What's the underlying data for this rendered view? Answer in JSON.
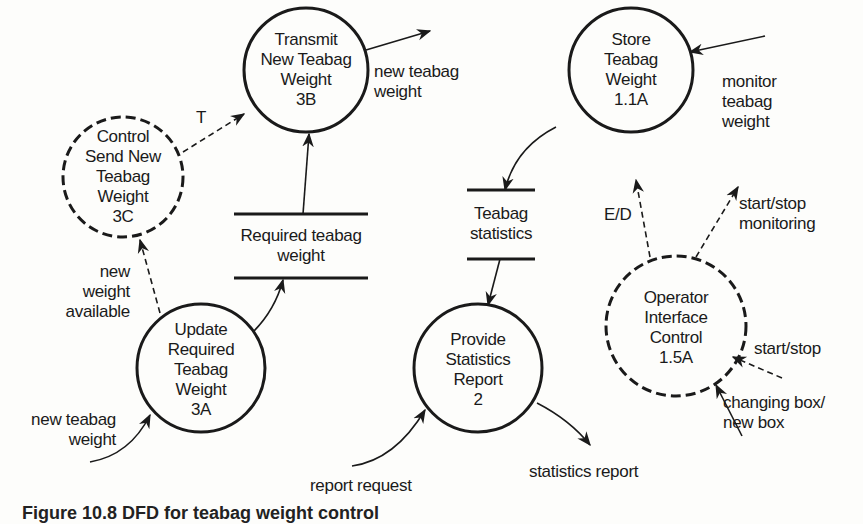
{
  "diagram": {
    "type": "data-flow-diagram",
    "processes": [
      {
        "id": "3C",
        "label": "Control\nSend New\nTeabag\nWeight\n3C",
        "style": "dashed",
        "kind": "control"
      },
      {
        "id": "3B",
        "label": "Transmit\nNew Teabag\nWeight\n3B",
        "style": "solid",
        "kind": "data"
      },
      {
        "id": "1.1A",
        "label": "Store\nTeabag\nWeight\n1.1A",
        "style": "solid",
        "kind": "data"
      },
      {
        "id": "1.5A",
        "label": "Operator\nInterface\nControl\n1.5A",
        "style": "dashed",
        "kind": "control"
      },
      {
        "id": "3A",
        "label": "Update\nRequired\nTeabag\nWeight\n3A",
        "style": "solid",
        "kind": "data"
      },
      {
        "id": "2",
        "label": "Provide\nStatistics\nReport\n2",
        "style": "solid",
        "kind": "data"
      }
    ],
    "stores": [
      {
        "id": "required-teabag-weight",
        "label": "Required teabag\nweight"
      },
      {
        "id": "teabag-statistics",
        "label": "Teabag\nstatistics"
      }
    ],
    "flows": [
      {
        "label": "T",
        "from": "3C",
        "to": "3B",
        "style": "dashed"
      },
      {
        "label": "new teabag\nweight",
        "from": "3B",
        "to": "external",
        "style": "solid"
      },
      {
        "label": "monitor\nteabag\nweight",
        "from": "external",
        "to": "1.1A",
        "style": "solid"
      },
      {
        "label": "",
        "from": "1.1A",
        "to": "teabag-statistics",
        "style": "solid"
      },
      {
        "label": "",
        "from": "teabag-statistics",
        "to": "2",
        "style": "solid"
      },
      {
        "label": "E/D",
        "from": "1.5A",
        "to": "1.1A",
        "style": "dashed"
      },
      {
        "label": "start/stop\nmonitoring",
        "from": "1.5A",
        "to": "external",
        "style": "dashed"
      },
      {
        "label": "start/stop",
        "from": "external",
        "to": "1.5A",
        "style": "dashed"
      },
      {
        "label": "changing box/\nnew box",
        "from": "external",
        "to": "1.5A",
        "style": "solid"
      },
      {
        "label": "new\nweight\navailable",
        "from": "3A",
        "to": "3C",
        "style": "dashed"
      },
      {
        "label": "",
        "from": "3A",
        "to": "required-teabag-weight",
        "style": "solid"
      },
      {
        "label": "",
        "from": "required-teabag-weight",
        "to": "3B",
        "style": "solid"
      },
      {
        "label": "new teabag\nweight",
        "from": "external",
        "to": "3A",
        "style": "solid"
      },
      {
        "label": "report request",
        "from": "external",
        "to": "2",
        "style": "solid"
      },
      {
        "label": "statistics report",
        "from": "2",
        "to": "external",
        "style": "solid"
      }
    ]
  },
  "caption": "Figure 10.8  DFD for teabag weight control"
}
